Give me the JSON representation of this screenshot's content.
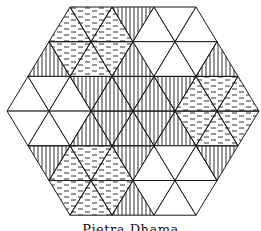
{
  "figure": {
    "type": "hexagonal triangular tiling pattern",
    "caption": "Pietra Dhama",
    "stroke_color": "#1a1a1a",
    "background": "#ffffff",
    "legend_fills": {
      "W": "white (empty)",
      "V": "vertical hatching",
      "D": "dashed horizontal hatching"
    },
    "rows": [
      [
        "D",
        "D",
        "D",
        "V",
        "W",
        "W",
        "W"
      ],
      [
        "V",
        "D",
        "D",
        "D",
        "V",
        "W",
        "W",
        "W",
        "V"
      ],
      [
        "W",
        "W",
        "W",
        "V",
        "V",
        "V",
        "V",
        "V",
        "D",
        "D",
        "D"
      ],
      [
        "W",
        "W",
        "W",
        "V",
        "V",
        "V",
        "V",
        "V",
        "D",
        "D",
        "D"
      ],
      [
        "V",
        "D",
        "D",
        "D",
        "V",
        "W",
        "W",
        "W",
        "V"
      ],
      [
        "D",
        "D",
        "D",
        "V",
        "W",
        "W",
        "W"
      ]
    ]
  }
}
